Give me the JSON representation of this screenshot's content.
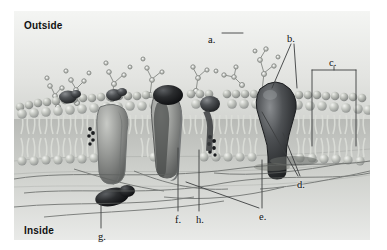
{
  "figure": {
    "type": "labeled-biology-illustration",
    "orientation_labels": {
      "top": "Outside",
      "bottom": "Inside"
    },
    "background_color": "#e8e9e7",
    "line_color": "#4a4a4a",
    "text_color": "#111111"
  },
  "callouts": [
    {
      "id": "a",
      "label": "a.",
      "points_to": "carbohydrate (oligosaccharide) chain projecting from the outer surface",
      "text_x": 208,
      "text_y": 35,
      "leaders": [
        {
          "x1": 222,
          "y1": 33,
          "x2": 243,
          "y2": 33
        }
      ]
    },
    {
      "id": "b",
      "label": "b.",
      "points_to": "phospholipid head groups of the outer leaflet",
      "text_x": 287,
      "text_y": 34,
      "leaders": [
        {
          "x1": 291,
          "y1": 44,
          "x2": 272,
          "y2": 88
        },
        {
          "x1": 294,
          "y1": 44,
          "x2": 297,
          "y2": 88
        }
      ]
    },
    {
      "id": "c",
      "label": "c.",
      "points_to": "phospholipid bilayer (membrane thickness)",
      "text_x": 329,
      "text_y": 58,
      "bracket": {
        "x": 312,
        "y": 70,
        "w": 44,
        "h": 76
      },
      "leaders": [
        {
          "x1": 334,
          "y1": 66,
          "x2": 334,
          "y2": 70
        }
      ]
    },
    {
      "id": "d",
      "label": "d.",
      "points_to": "integral (transmembrane) protein spanning the bilayer",
      "text_x": 297,
      "text_y": 180,
      "leaders": [
        {
          "x1": 298,
          "y1": 176,
          "x2": 262,
          "y2": 112
        },
        {
          "x1": 300,
          "y1": 176,
          "x2": 283,
          "y2": 133
        }
      ]
    },
    {
      "id": "e",
      "label": "e.",
      "points_to": "cytoskeletal filaments on the inner surface",
      "text_x": 259,
      "text_y": 212,
      "leaders": [
        {
          "x1": 262,
          "y1": 208,
          "x2": 262,
          "y2": 160
        },
        {
          "x1": 259,
          "y1": 208,
          "x2": 186,
          "y2": 182
        }
      ]
    },
    {
      "id": "f",
      "label": "f.",
      "points_to": "channel / carrier protein forming a pore",
      "text_x": 175,
      "text_y": 215,
      "leaders": [
        {
          "x1": 178,
          "y1": 211,
          "x2": 178,
          "y2": 148
        }
      ]
    },
    {
      "id": "h",
      "label": "h.",
      "points_to": "cholesterol molecule wedged between lipid tails",
      "text_x": 196,
      "text_y": 215,
      "leaders": [
        {
          "x1": 199,
          "y1": 211,
          "x2": 199,
          "y2": 150
        }
      ]
    },
    {
      "id": "g",
      "label": "g.",
      "points_to": "peripheral protein attached to the inner leaflet",
      "text_x": 98,
      "text_y": 232,
      "leaders": [
        {
          "x1": 101,
          "y1": 228,
          "x2": 101,
          "y2": 204
        }
      ]
    }
  ],
  "structures": {
    "bilayer": {
      "head_color": "#b9bcb6",
      "head_highlight": "#e6e8e3",
      "tail_color": "#d2d4ce",
      "outer_leaflet_y": 95,
      "inner_leaflet_y": 150
    },
    "proteins": [
      {
        "name": "large-integral-protein-right",
        "color": "#4f5153",
        "cx": 262,
        "cy": 110
      },
      {
        "name": "channel-protein-center",
        "color": "#8e9091",
        "cx": 160,
        "cy": 135
      },
      {
        "name": "globular-protein-upper-center",
        "color": "#3d3f41",
        "cx": 168,
        "cy": 92
      },
      {
        "name": "small-protein-mid",
        "color": "#4a4c4e",
        "cx": 203,
        "cy": 105
      },
      {
        "name": "protein-left-a",
        "color": "#5a5c5e",
        "cx": 68,
        "cy": 98
      },
      {
        "name": "protein-left-b",
        "color": "#4a4c4e",
        "cx": 114,
        "cy": 100
      },
      {
        "name": "carrier-protein-left",
        "color": "#9a9c9a",
        "cx": 110,
        "cy": 140
      },
      {
        "name": "peripheral-protein-bottom",
        "color": "#232527",
        "cx": 98,
        "cy": 198
      }
    ],
    "carbohydrate_chains": 7,
    "cytoskeleton_filaments": 9
  }
}
